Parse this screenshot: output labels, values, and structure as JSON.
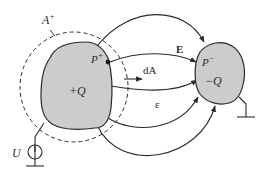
{
  "diagram": {
    "type": "electrostatics-capacitor",
    "colors": {
      "conductor_fill": "#cccccc",
      "stroke": "#2a2a2a",
      "background": "#ffffff"
    },
    "labels": {
      "surface": "A",
      "surface_sup": "+",
      "point_pos": "P",
      "point_pos_sup": "+",
      "point_neg": "P",
      "point_neg_sup": "−",
      "charge_pos": "+Q",
      "charge_neg": "−Q",
      "field": "E",
      "area_element": "dA",
      "permittivity": "ε",
      "voltage_source": "U"
    },
    "nodes": [
      {
        "id": "conductor-positive",
        "label": "+Q"
      },
      {
        "id": "conductor-negative",
        "label": "−Q"
      },
      {
        "id": "gaussian-surface",
        "label": "A+"
      },
      {
        "id": "voltage-source",
        "label": "U"
      },
      {
        "id": "ground-left"
      },
      {
        "id": "ground-right"
      }
    ],
    "edges": [
      {
        "from": "conductor-positive",
        "to": "conductor-negative",
        "kind": "field-line",
        "count": 5
      }
    ]
  }
}
